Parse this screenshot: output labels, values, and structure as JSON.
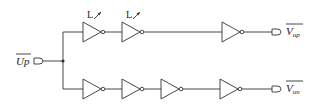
{
  "diagram": {
    "title": "",
    "input": {
      "label": "Up",
      "overbar": true
    },
    "outputs": [
      {
        "label": "V",
        "subscript": "up",
        "overbar": true
      },
      {
        "label": "V",
        "subscript": "un",
        "overbar": true
      }
    ],
    "top_chain": {
      "inverters": 3,
      "adjustable_labels": [
        "L",
        "L"
      ]
    },
    "bottom_chain": {
      "inverters": 4
    },
    "colors": {
      "line": "#333333",
      "background": "#ffffff"
    }
  }
}
